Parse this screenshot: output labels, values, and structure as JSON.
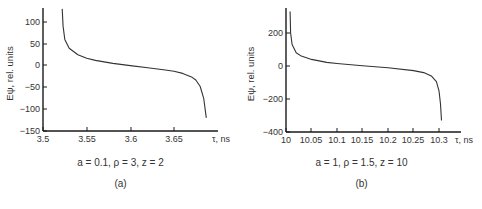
{
  "chart_data": [
    {
      "type": "line",
      "panel_label": "(a)",
      "caption": "a = 0.1, ρ = 3, z = 2",
      "title": "",
      "xlabel": "τ, ns",
      "ylabel": "E_ψ, rel. units",
      "xlim": [
        3.5,
        3.7
      ],
      "ylim": [
        -150,
        130
      ],
      "xticks": [
        3.5,
        3.55,
        3.6,
        3.65
      ],
      "xtick_labels": [
        "3.5",
        "3.55",
        "3.6",
        "3.65"
      ],
      "yticks": [
        100,
        50,
        0,
        -50,
        -100,
        -150
      ],
      "ytick_labels": [
        "100",
        "50",
        "0",
        "−50",
        "−100",
        "−150"
      ],
      "grid": false,
      "series": [
        {
          "name": "E_psi",
          "x": [
            3.522,
            3.523,
            3.525,
            3.53,
            3.54,
            3.55,
            3.56,
            3.58,
            3.6,
            3.62,
            3.64,
            3.65,
            3.66,
            3.67,
            3.675,
            3.68,
            3.684,
            3.687
          ],
          "y": [
            130,
            90,
            60,
            40,
            25,
            17,
            12,
            5,
            0,
            -5,
            -10,
            -13,
            -18,
            -26,
            -33,
            -48,
            -75,
            -120
          ]
        }
      ]
    },
    {
      "type": "line",
      "panel_label": "(b)",
      "caption": "a = 1, ρ = 1.5, z = 10",
      "title": "",
      "xlabel": "τ, ns",
      "ylabel": "E_ψ, rel. units",
      "xlim": [
        10,
        10.33
      ],
      "ylim": [
        -400,
        330
      ],
      "xticks": [
        10,
        10.05,
        10.1,
        10.15,
        10.2,
        10.25,
        10.3
      ],
      "xtick_labels": [
        "10",
        "10.05",
        "10.1",
        "10.15",
        "10.2",
        "10.25",
        "10.3"
      ],
      "yticks": [
        200,
        0,
        -200,
        -400
      ],
      "ytick_labels": [
        "200",
        "0",
        "−200",
        "−400"
      ],
      "grid": false,
      "series": [
        {
          "name": "E_psi",
          "x": [
            10.008,
            10.009,
            10.012,
            10.02,
            10.03,
            10.05,
            10.08,
            10.1,
            10.15,
            10.2,
            10.25,
            10.27,
            10.285,
            10.295,
            10.3,
            10.303,
            10.305
          ],
          "y": [
            330,
            200,
            130,
            80,
            60,
            40,
            22,
            15,
            2,
            -10,
            -28,
            -40,
            -60,
            -95,
            -150,
            -230,
            -330
          ]
        }
      ]
    }
  ],
  "panels": {
    "a": {
      "caption": "a = 0.1, ρ = 3, z = 2",
      "label": "(a)",
      "ylabel": "E_ψ, rel. units",
      "xlabel": "τ, ns"
    },
    "b": {
      "caption": "a = 1, ρ = 1.5, z = 10",
      "label": "(b)",
      "ylabel": "E_ψ, rel. units",
      "xlabel": "τ, ns"
    }
  },
  "colors": {
    "axis": "#1a1a1a",
    "curve": "#333333",
    "text": "#333333"
  }
}
